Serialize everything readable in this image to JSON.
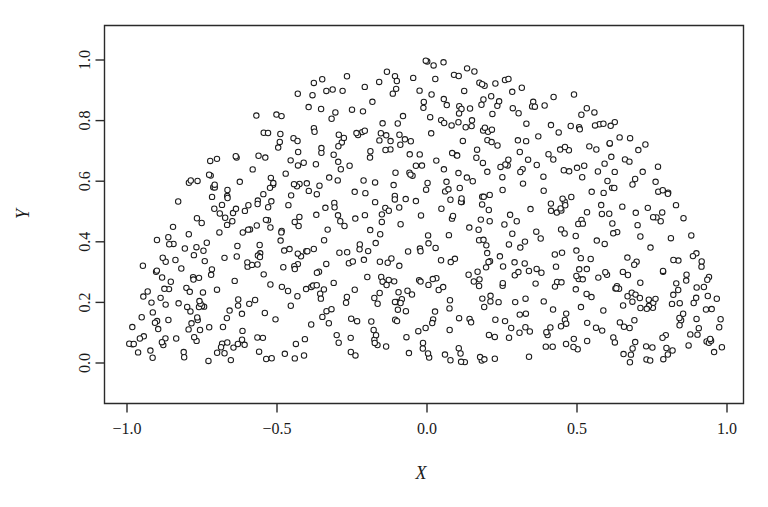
{
  "chart_data": {
    "type": "scatter",
    "title": "",
    "subtitle": "",
    "xlabel": "X",
    "ylabel": "Y",
    "xlim": [
      -1.15,
      1.1
    ],
    "ylim": [
      -0.07,
      1.09
    ],
    "xticks": [
      -1.0,
      -0.5,
      0.0,
      0.5,
      1.0
    ],
    "xticklabels": [
      "−1.0",
      "−0.5",
      "0.0",
      "0.5",
      "1.0"
    ],
    "yticks": [
      0.0,
      0.2,
      0.4,
      0.6,
      0.8,
      1.0
    ],
    "yticklabels": [
      "0.0",
      "0.2",
      "0.4",
      "0.6",
      "0.8",
      "1.0"
    ],
    "grid": false,
    "legend": null,
    "marker": "open-circle",
    "marker_size_px": 5.4,
    "marker_color": "#1c1c1c",
    "marker_fill": "#ffffff",
    "n_points": 800,
    "distribution": "uniform over upper unit half-disk (y >= 0, x^2 + y^2 <= 1)",
    "points": [
      [
        -0.982,
        0.062
      ],
      [
        -0.963,
        0.035
      ],
      [
        -0.951,
        0.151
      ],
      [
        -0.944,
        0.088
      ],
      [
        -0.931,
        0.236
      ],
      [
        -0.922,
        0.041
      ],
      [
        -0.914,
        0.167
      ],
      [
        -0.903,
        0.301
      ],
      [
        -0.896,
        0.112
      ],
      [
        -0.888,
        0.215
      ],
      [
        -0.879,
        0.059
      ],
      [
        -0.871,
        0.334
      ],
      [
        -0.862,
        0.142
      ],
      [
        -0.854,
        0.268
      ],
      [
        -0.845,
        0.393
      ],
      [
        -0.836,
        0.081
      ],
      [
        -0.828,
        0.197
      ],
      [
        -0.819,
        0.312
      ],
      [
        -0.811,
        0.036
      ],
      [
        -0.802,
        0.248
      ],
      [
        -0.794,
        0.425
      ],
      [
        -0.785,
        0.131
      ],
      [
        -0.777,
        0.356
      ],
      [
        -0.768,
        0.073
      ],
      [
        -0.76,
        0.281
      ],
      [
        -0.751,
        0.462
      ],
      [
        -0.743,
        0.186
      ],
      [
        -0.734,
        0.397
      ],
      [
        -0.726,
        0.118
      ],
      [
        -0.717,
        0.309
      ],
      [
        -0.709,
        0.509
      ],
      [
        -0.7,
        0.242
      ],
      [
        -0.692,
        0.431
      ],
      [
        -0.683,
        0.064
      ],
      [
        -0.675,
        0.347
      ],
      [
        -0.666,
        0.551
      ],
      [
        -0.658,
        0.173
      ],
      [
        -0.649,
        0.468
      ],
      [
        -0.641,
        0.271
      ],
      [
        -0.632,
        0.386
      ],
      [
        -0.624,
        0.598
      ],
      [
        -0.615,
        0.106
      ],
      [
        -0.607,
        0.502
      ],
      [
        -0.598,
        0.318
      ],
      [
        -0.59,
        0.441
      ],
      [
        -0.581,
        0.639
      ],
      [
        -0.573,
        0.208
      ],
      [
        -0.564,
        0.536
      ],
      [
        -0.556,
        0.362
      ],
      [
        -0.547,
        0.083
      ],
      [
        -0.539,
        0.678
      ],
      [
        -0.53,
        0.471
      ],
      [
        -0.522,
        0.259
      ],
      [
        -0.513,
        0.588
      ],
      [
        -0.505,
        0.144
      ],
      [
        -0.496,
        0.711
      ],
      [
        -0.488,
        0.404
      ],
      [
        -0.479,
        0.316
      ],
      [
        -0.471,
        0.625
      ],
      [
        -0.462,
        0.521
      ],
      [
        -0.454,
        0.189
      ],
      [
        -0.445,
        0.742
      ],
      [
        -0.437,
        0.063
      ],
      [
        -0.428,
        0.452
      ],
      [
        -0.42,
        0.352
      ],
      [
        -0.411,
        0.661
      ],
      [
        -0.403,
        0.244
      ],
      [
        -0.394,
        0.568
      ],
      [
        -0.386,
        0.127
      ],
      [
        -0.377,
        0.775
      ],
      [
        -0.369,
        0.489
      ],
      [
        -0.36,
        0.301
      ],
      [
        -0.352,
        0.694
      ],
      [
        -0.343,
        0.405
      ],
      [
        -0.335,
        0.171
      ],
      [
        -0.326,
        0.612
      ],
      [
        -0.318,
        0.806
      ],
      [
        -0.309,
        0.528
      ],
      [
        -0.301,
        0.092
      ],
      [
        -0.292,
        0.364
      ],
      [
        -0.284,
        0.728
      ],
      [
        -0.275,
        0.452
      ],
      [
        -0.267,
        0.218
      ],
      [
        -0.258,
        0.651
      ],
      [
        -0.25,
        0.836
      ],
      [
        -0.241,
        0.565
      ],
      [
        -0.233,
        0.138
      ],
      [
        -0.224,
        0.391
      ],
      [
        -0.216,
        0.762
      ],
      [
        -0.207,
        0.488
      ],
      [
        -0.199,
        0.284
      ],
      [
        -0.19,
        0.678
      ],
      [
        -0.182,
        0.862
      ],
      [
        -0.173,
        0.596
      ],
      [
        -0.165,
        0.059
      ],
      [
        -0.156,
        0.425
      ],
      [
        -0.148,
        0.791
      ],
      [
        -0.139,
        0.512
      ],
      [
        -0.131,
        0.331
      ],
      [
        -0.122,
        0.705
      ],
      [
        -0.114,
        0.889
      ],
      [
        -0.105,
        0.628
      ],
      [
        -0.097,
        0.176
      ],
      [
        -0.088,
        0.458
      ],
      [
        -0.08,
        0.815
      ],
      [
        -0.071,
        0.541
      ],
      [
        -0.063,
        0.368
      ],
      [
        -0.054,
        0.732
      ],
      [
        -0.046,
        0.941
      ],
      [
        -0.037,
        0.651
      ],
      [
        -0.029,
        0.105
      ],
      [
        -0.02,
        0.487
      ],
      [
        -0.012,
        0.842
      ],
      [
        -0.003,
        0.572
      ],
      [
        0.005,
        0.395
      ],
      [
        0.014,
        0.758
      ],
      [
        0.022,
        0.982
      ],
      [
        0.031,
        0.668
      ],
      [
        0.039,
        0.241
      ],
      [
        0.048,
        0.509
      ],
      [
        0.056,
        0.871
      ],
      [
        0.065,
        0.598
      ],
      [
        0.073,
        0.422
      ],
      [
        0.082,
        0.784
      ],
      [
        0.09,
        0.951
      ],
      [
        0.099,
        0.686
      ],
      [
        0.107,
        0.148
      ],
      [
        0.116,
        0.531
      ],
      [
        0.124,
        0.898
      ],
      [
        0.133,
        0.612
      ],
      [
        0.141,
        0.447
      ],
      [
        0.15,
        0.801
      ],
      [
        0.158,
        0.962
      ],
      [
        0.167,
        0.704
      ],
      [
        0.175,
        0.276
      ],
      [
        0.184,
        0.549
      ],
      [
        0.192,
        0.915
      ],
      [
        0.201,
        0.631
      ],
      [
        0.209,
        0.468
      ],
      [
        0.218,
        0.822
      ],
      [
        0.226,
        0.086
      ],
      [
        0.235,
        0.718
      ],
      [
        0.243,
        0.352
      ],
      [
        0.252,
        0.571
      ],
      [
        0.26,
        0.934
      ],
      [
        0.269,
        0.652
      ],
      [
        0.277,
        0.489
      ],
      [
        0.286,
        0.841
      ],
      [
        0.294,
        0.201
      ],
      [
        0.303,
        0.735
      ],
      [
        0.311,
        0.381
      ],
      [
        0.32,
        0.592
      ],
      [
        0.328,
        0.118
      ],
      [
        0.337,
        0.671
      ],
      [
        0.345,
        0.508
      ],
      [
        0.354,
        0.862
      ],
      [
        0.362,
        0.262
      ],
      [
        0.371,
        0.748
      ],
      [
        0.379,
        0.411
      ],
      [
        0.388,
        0.615
      ],
      [
        0.396,
        0.054
      ],
      [
        0.405,
        0.689
      ],
      [
        0.413,
        0.526
      ],
      [
        0.422,
        0.878
      ],
      [
        0.43,
        0.318
      ],
      [
        0.439,
        0.761
      ],
      [
        0.447,
        0.441
      ],
      [
        0.456,
        0.636
      ],
      [
        0.464,
        0.163
      ],
      [
        0.473,
        0.702
      ],
      [
        0.481,
        0.548
      ],
      [
        0.49,
        0.886
      ],
      [
        0.498,
        0.371
      ],
      [
        0.507,
        0.778
      ],
      [
        0.515,
        0.472
      ],
      [
        0.524,
        0.651
      ],
      [
        0.532,
        0.228
      ],
      [
        0.541,
        0.715
      ],
      [
        0.549,
        0.565
      ],
      [
        0.558,
        0.827
      ],
      [
        0.566,
        0.404
      ],
      [
        0.575,
        0.788
      ],
      [
        0.583,
        0.492
      ],
      [
        0.592,
        0.658
      ],
      [
        0.6,
        0.291
      ],
      [
        0.609,
        0.724
      ],
      [
        0.617,
        0.578
      ],
      [
        0.626,
        0.795
      ],
      [
        0.634,
        0.432
      ],
      [
        0.643,
        0.134
      ],
      [
        0.651,
        0.516
      ],
      [
        0.66,
        0.672
      ],
      [
        0.668,
        0.348
      ],
      [
        0.677,
        0.742
      ],
      [
        0.685,
        0.589
      ],
      [
        0.694,
        0.069
      ],
      [
        0.702,
        0.455
      ],
      [
        0.711,
        0.265
      ],
      [
        0.719,
        0.631
      ],
      [
        0.728,
        0.721
      ],
      [
        0.736,
        0.512
      ],
      [
        0.745,
        0.381
      ],
      [
        0.753,
        0.182
      ],
      [
        0.762,
        0.598
      ],
      [
        0.77,
        0.648
      ],
      [
        0.779,
        0.468
      ],
      [
        0.787,
        0.301
      ],
      [
        0.796,
        0.092
      ],
      [
        0.804,
        0.562
      ],
      [
        0.813,
        0.412
      ],
      [
        0.821,
        0.225
      ],
      [
        0.83,
        0.521
      ],
      [
        0.838,
        0.338
      ],
      [
        0.847,
        0.141
      ],
      [
        0.855,
        0.478
      ],
      [
        0.864,
        0.272
      ],
      [
        0.872,
        0.058
      ],
      [
        0.881,
        0.421
      ],
      [
        0.889,
        0.198
      ],
      [
        0.898,
        0.362
      ],
      [
        0.906,
        0.115
      ],
      [
        0.915,
        0.318
      ],
      [
        0.923,
        0.251
      ],
      [
        0.932,
        0.071
      ],
      [
        0.94,
        0.284
      ],
      [
        0.949,
        0.178
      ],
      [
        0.957,
        0.036
      ],
      [
        0.966,
        0.212
      ],
      [
        0.974,
        0.118
      ],
      [
        0.983,
        0.052
      ]
    ]
  },
  "axes": {
    "x_axis_title": "X",
    "y_axis_title": "Y"
  }
}
